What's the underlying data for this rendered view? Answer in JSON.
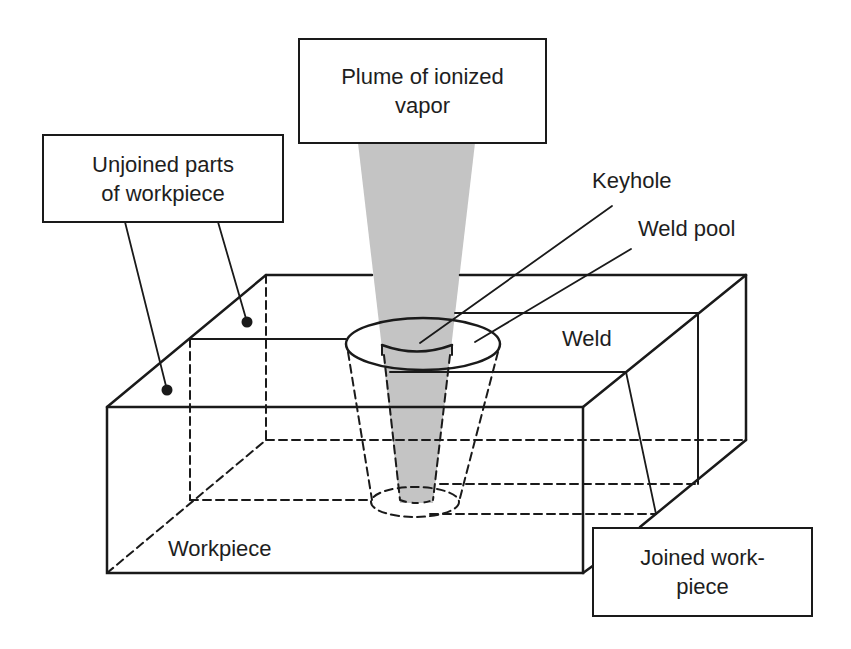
{
  "diagram": {
    "colors": {
      "line": "#1a1a1a",
      "beam": "#c4c4c4",
      "background": "#ffffff"
    },
    "labels": {
      "plume": {
        "line1": "Plume of ionized",
        "line2": "vapor"
      },
      "unjoined": {
        "line1": "Unjoined parts",
        "line2": "of workpiece"
      },
      "keyhole": "Keyhole",
      "weld_pool": "Weld pool",
      "weld": "Weld",
      "workpiece": "Workpiece",
      "joined": {
        "line1": "Joined work-",
        "line2": "piece"
      }
    }
  }
}
